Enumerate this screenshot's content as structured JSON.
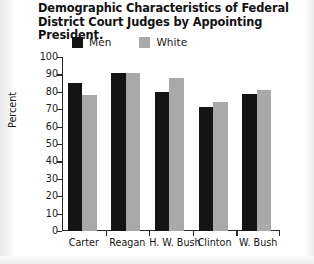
{
  "chart_data": {
    "type": "bar",
    "title": "Demographic Characteristics of Federal District Court Judges by Appointing President.",
    "xlabel": "",
    "ylabel": "Percent",
    "ylim": [
      0,
      100
    ],
    "ytick_step": 10,
    "yticks": [
      "100",
      "90",
      "80",
      "70",
      "60",
      "50",
      "40",
      "30",
      "20",
      "10",
      "0"
    ],
    "grid": false,
    "legend_position": "top",
    "categories": [
      "Carter",
      "Reagan",
      "H. W. Bush",
      "Clinton",
      "W. Bush"
    ],
    "series": [
      {
        "name": "Men",
        "color": "#141414",
        "values": [
          85,
          91,
          80,
          71,
          79
        ]
      },
      {
        "name": "White",
        "color": "#a9a9a9",
        "values": [
          78,
          91,
          88,
          74,
          81
        ]
      }
    ]
  }
}
